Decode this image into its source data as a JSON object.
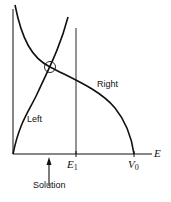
{
  "diagram": {
    "axis_label_x": "E",
    "curve_labels": {
      "left": "Left",
      "right": "Right"
    },
    "tick_labels": {
      "e1": {
        "main": "E",
        "sub": "1"
      },
      "v0": {
        "main": "V",
        "sub": "0"
      }
    },
    "annotation": "Solution",
    "colors": {
      "line": "#111111",
      "background": "#ffffff"
    }
  }
}
